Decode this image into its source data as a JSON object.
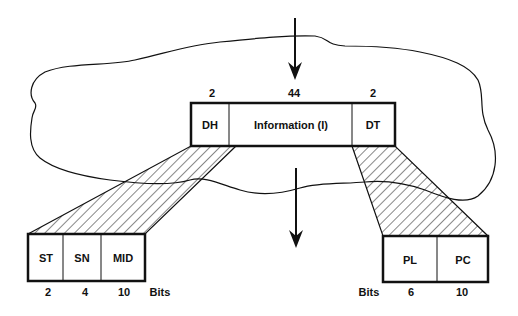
{
  "diagram": {
    "top_frame": {
      "fields": [
        {
          "label": "DH",
          "bits": "2"
        },
        {
          "label": "Information (I)",
          "bits": "44"
        },
        {
          "label": "DT",
          "bits": "2"
        }
      ]
    },
    "header_expansion": {
      "fields": [
        {
          "label": "ST",
          "bits": "2"
        },
        {
          "label": "SN",
          "bits": "4"
        },
        {
          "label": "MID",
          "bits": "10"
        }
      ],
      "unit_label": "Bits"
    },
    "trailer_expansion": {
      "fields": [
        {
          "label": "PL",
          "bits": "6"
        },
        {
          "label": "PC",
          "bits": "10"
        }
      ],
      "unit_label": "Bits"
    },
    "arrows": [
      "arrow-in",
      "arrow-out"
    ],
    "colors": {
      "stroke": "#111111",
      "background": "#ffffff"
    }
  }
}
